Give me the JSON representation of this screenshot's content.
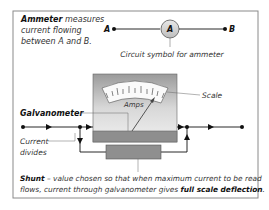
{
  "intro": {
    "bold": "Ammeter",
    "line1_rest": " measures",
    "line2": "current flowing",
    "line3": "between A and B."
  },
  "symbol": {
    "node_a": "A",
    "node_b": "B",
    "meter_letter": "A",
    "caption": "Circuit symbol for ammeter"
  },
  "meter": {
    "scale_text": "Amps",
    "scale_label": "Scale",
    "galvanometer_label": "Galvanometer",
    "current_divides_line1": "Current",
    "current_divides_line2": "divides"
  },
  "shunt": {
    "bold": "Shunt",
    "line1_rest": " – value chosen so that when maximum current to be read",
    "line2_start": "flows, current through galvanometer gives ",
    "line2_bold": "full scale deflection",
    "line2_end": "."
  },
  "colors": {
    "border": "#8a8a8a",
    "meter_body": "#b5b5b5",
    "meter_face": "#e9e9e9",
    "shunt_fill": "#8f8f8f",
    "line": "#111111"
  }
}
